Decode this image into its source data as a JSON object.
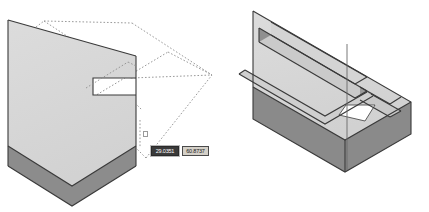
{
  "app": {
    "kind": "cad-3d-modeling-viewport",
    "background_color": "#ffffff",
    "panel_count": 2
  },
  "colors": {
    "top_face": "#d7d7d7",
    "top_face_light": "#dedede",
    "side_face_dark": "#8c8c8c",
    "side_face_mid": "#a8a8a8",
    "groove_shadow": "#9a9a9a",
    "outline": "#3a3a3a",
    "construction_line": "#8f8f8f",
    "widget_face": "#d4d0c8",
    "widget_border": "#3c3c3c",
    "selected_fill": "#3a3a3a",
    "selected_text": "#ffffff"
  },
  "left_panel": {
    "name": "before-view",
    "description": "Isometric solid block with a notch, rubber-band dotted construction rectangle being dragged to define a new feature",
    "coordinate_entry": {
      "x_field": {
        "value": "29.0351",
        "placeholder": "29.0351",
        "selected": true
      },
      "y_field": {
        "value": "60.8737",
        "placeholder": "60.8737",
        "selected": false
      }
    },
    "pick_marker_label": "pick-box-cursor"
  },
  "right_panel": {
    "name": "after-view",
    "description": "Isometric solid block with completed rectangular groove cut into the top face",
    "dimension_input": {
      "value": "12",
      "placeholder": "12"
    },
    "command_prompt": {
      "label": "Command:",
      "value": ""
    }
  }
}
